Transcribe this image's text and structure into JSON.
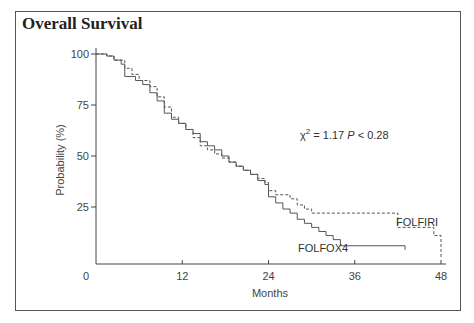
{
  "chart_data": {
    "type": "line",
    "subtype": "kaplan-meier step",
    "title": "Overall Survival",
    "xlabel": "Months",
    "ylabel": "Probability (%)",
    "xlim": [
      0,
      48
    ],
    "ylim": [
      0,
      100
    ],
    "xticks": [
      0,
      12,
      24,
      36,
      48
    ],
    "yticks": [
      25,
      50,
      75,
      100
    ],
    "grid": false,
    "legend": "inline labels",
    "annotation": {
      "chi2_label": "χ",
      "chi2_sup": "2",
      "stat_text": " = 1.17 ",
      "p_label": "P",
      "p_text": " < 0.28"
    },
    "series": [
      {
        "name": "FOLFOX4",
        "style": "solid",
        "x": [
          0,
          1.5,
          2.5,
          3.5,
          4,
          5.5,
          6.5,
          7.5,
          8.5,
          9.5,
          10.5,
          11.5,
          12.5,
          13.5,
          14.5,
          15.5,
          16.5,
          17.5,
          18.5,
          19.5,
          20.5,
          21.5,
          22.5,
          23.5,
          24,
          25,
          26,
          27,
          28,
          29,
          30,
          31,
          32,
          33,
          34,
          43
        ],
        "y": [
          100,
          99,
          97,
          95,
          89,
          87,
          85,
          81,
          77,
          71,
          68,
          66,
          63,
          61,
          57,
          55,
          53,
          50,
          47,
          45,
          43,
          41,
          38,
          36,
          30,
          27,
          24,
          22,
          19,
          17,
          15,
          13,
          11,
          9,
          6,
          4
        ]
      },
      {
        "name": "FOLFIRI",
        "style": "dashed",
        "x": [
          0,
          1.5,
          2.5,
          4,
          5,
          6,
          7.5,
          8.5,
          9.5,
          10.5,
          11.5,
          12.5,
          13.5,
          14.5,
          15.5,
          16.5,
          17.5,
          18.5,
          19.5,
          20.5,
          21.5,
          22.5,
          23.5,
          24,
          25,
          27,
          28,
          29,
          30,
          41,
          42,
          46,
          47,
          48
        ],
        "y": [
          100,
          99,
          97,
          93,
          90,
          87,
          84,
          79,
          74,
          69,
          66,
          63,
          59,
          55,
          53,
          51,
          49,
          47,
          45,
          43,
          41,
          39,
          37,
          33,
          31,
          29,
          26,
          24,
          22,
          22,
          15,
          15,
          11,
          0
        ]
      }
    ]
  },
  "labels": {
    "title": "Overall Survival",
    "xlabel": "Months",
    "ylabel": "Probability (%)",
    "xticks": [
      "0",
      "12",
      "24",
      "36",
      "48"
    ],
    "yticks": [
      "100",
      "75",
      "50",
      "25"
    ],
    "series_folfox": "FOLFOX4",
    "series_folfiri": "FOLFIRI"
  }
}
